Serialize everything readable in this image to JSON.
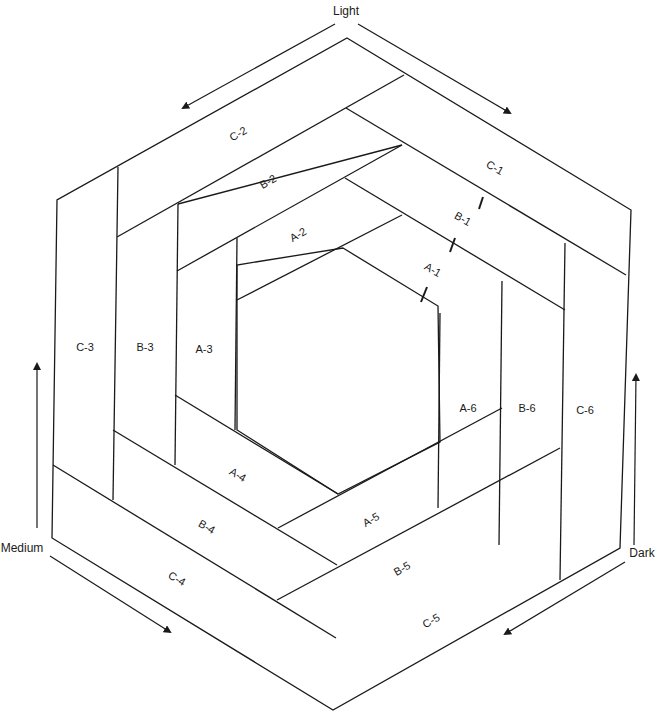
{
  "diagram": {
    "type": "quilt-block-piecing-diagram",
    "shape": "hexagon",
    "direction_labels": {
      "top": "Light",
      "left": "Medium",
      "right": "Dark"
    },
    "pieces": {
      "A1": "A-1",
      "A2": "A-2",
      "A3": "A-3",
      "A4": "A-4",
      "A5": "A-5",
      "A6": "A-6",
      "B1": "B-1",
      "B2": "B-2",
      "B3": "B-3",
      "B4": "B-4",
      "B5": "B-5",
      "B6": "B-6",
      "C1": "C-1",
      "C2": "C-2",
      "C3": "C-3",
      "C4": "C-4",
      "C5": "C-5",
      "C6": "C-6"
    },
    "rings": [
      {
        "name": "A",
        "pieces": [
          "A-1",
          "A-2",
          "A-3",
          "A-4",
          "A-5",
          "A-6"
        ]
      },
      {
        "name": "B",
        "pieces": [
          "B-1",
          "B-2",
          "B-3",
          "B-4",
          "B-5",
          "B-6"
        ]
      },
      {
        "name": "C",
        "pieces": [
          "C-1",
          "C-2",
          "C-3",
          "C-4",
          "C-5",
          "C-6"
        ]
      }
    ],
    "stroke_color": "#1a1a1a",
    "background": "#ffffff"
  }
}
